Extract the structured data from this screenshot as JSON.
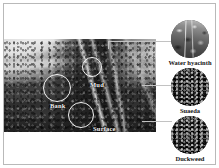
{
  "figure": {
    "type": "annotated-photograph-with-circular-insets",
    "background_color": "#ffffff",
    "frame_color": "#b9b9b9",
    "annotation_color": "#f3f3f3",
    "caption_color": "#141414"
  },
  "scene": {
    "name": "wetland-survey-photo",
    "description": "Grayscale aerial/oblique photograph of a wetland bank with water channel",
    "annotations": [
      {
        "id": "mud",
        "label": "Mud",
        "circle": {
          "x": 78,
          "y": 57,
          "d": 20
        },
        "label_x": 86,
        "label_y": 82
      },
      {
        "id": "bank",
        "label": "Bank",
        "circle": {
          "x": 39,
          "y": 74,
          "d": 28
        },
        "label_x": 46,
        "label_y": 103
      },
      {
        "id": "surface",
        "label": "Surface",
        "circle": {
          "x": 64,
          "y": 102,
          "d": 26
        },
        "label_x": 95,
        "label_y": 126
      }
    ]
  },
  "insets": [
    {
      "id": "water-hyacinth",
      "caption": "Water hyacinth",
      "thumb_name": "water-hyacinth-thumbnail",
      "connector_y": 41
    },
    {
      "id": "suaeda",
      "caption": "Suaeda",
      "thumb_name": "suaeda-thumbnail",
      "connector_y": 85
    },
    {
      "id": "duckweed",
      "caption": "Duckweed",
      "thumb_name": "duckweed-thumbnail",
      "connector_y": 121
    }
  ]
}
